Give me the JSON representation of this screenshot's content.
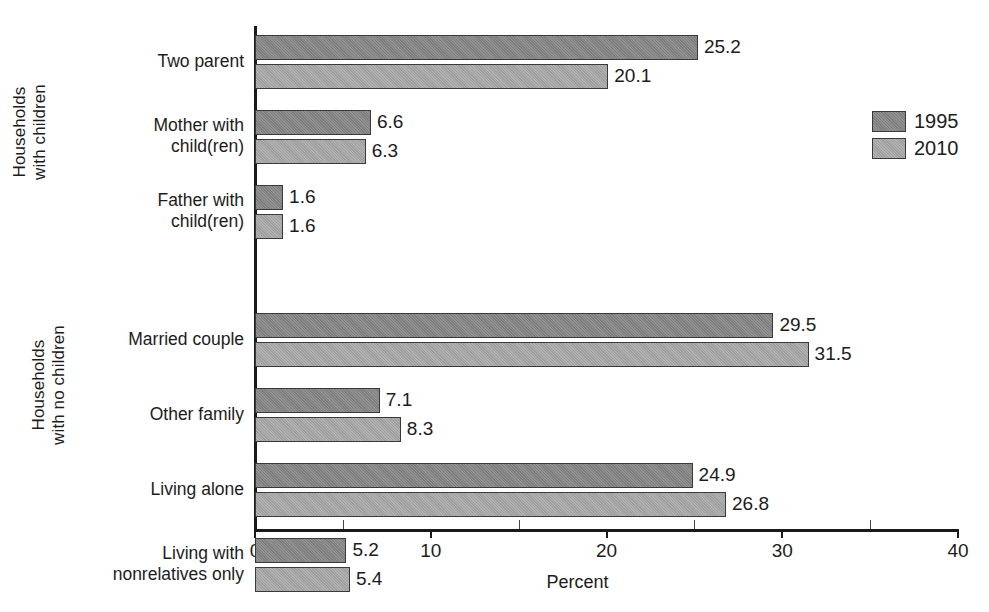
{
  "chart_data": {
    "type": "bar",
    "orientation": "horizontal",
    "title": "",
    "xlabel": "Percent",
    "ylabel": "",
    "xlim": [
      0,
      40
    ],
    "xticks": [
      0,
      10,
      20,
      30,
      40
    ],
    "xtick_labels": [
      "0",
      "10",
      "20",
      "30",
      "40"
    ],
    "minor_xticks": [
      5,
      15,
      25,
      35
    ],
    "grid": false,
    "legend_position": "right",
    "series": [
      {
        "name": "1995",
        "color": "#858585",
        "values": [
          25.2,
          6.6,
          1.6,
          29.5,
          7.1,
          24.9,
          5.2
        ]
      },
      {
        "name": "2010",
        "color": "#a5a5a5",
        "values": [
          20.1,
          6.3,
          1.6,
          31.5,
          8.3,
          26.8,
          5.4
        ]
      }
    ],
    "categories": [
      "Two parent",
      "Mother with child(ren)",
      "Father with child(ren)",
      "Married couple",
      "Other family",
      "Living alone",
      "Living with nonrelatives only"
    ],
    "groups": [
      {
        "caption": "Households with children",
        "categories": [
          0,
          1,
          2
        ]
      },
      {
        "caption": "Households with no children",
        "categories": [
          3,
          4,
          5,
          6
        ]
      }
    ]
  },
  "axis": {
    "x_title": "Percent",
    "tick_labels": [
      "0",
      "10",
      "20",
      "30",
      "40"
    ]
  },
  "group_captions": {
    "children": {
      "line1": "Households",
      "line2": "with children"
    },
    "no_children": {
      "line1": "Households",
      "line2": "with no children"
    }
  },
  "categories": [
    {
      "id": "two-parent",
      "line1": "Two parent",
      "line2": ""
    },
    {
      "id": "mother-with-children",
      "line1": "Mother with",
      "line2": "child(ren)"
    },
    {
      "id": "father-with-children",
      "line1": "Father with",
      "line2": "child(ren)"
    },
    {
      "id": "married-couple",
      "line1": "Married couple",
      "line2": ""
    },
    {
      "id": "other-family",
      "line1": "Other family",
      "line2": ""
    },
    {
      "id": "living-alone",
      "line1": "Living alone",
      "line2": ""
    },
    {
      "id": "living-nonrelatives",
      "line1": "Living with",
      "line2": "nonrelatives only"
    }
  ],
  "bars": [
    {
      "id": "two-parent-1995",
      "series": "1995",
      "value": 25.2,
      "label": "25.2"
    },
    {
      "id": "two-parent-2010",
      "series": "2010",
      "value": 20.1,
      "label": "20.1"
    },
    {
      "id": "mother-1995",
      "series": "1995",
      "value": 6.6,
      "label": "6.6"
    },
    {
      "id": "mother-2010",
      "series": "2010",
      "value": 6.3,
      "label": "6.3"
    },
    {
      "id": "father-1995",
      "series": "1995",
      "value": 1.6,
      "label": "1.6"
    },
    {
      "id": "father-2010",
      "series": "2010",
      "value": 1.6,
      "label": "1.6"
    },
    {
      "id": "married-couple-1995",
      "series": "1995",
      "value": 29.5,
      "label": "29.5"
    },
    {
      "id": "married-couple-2010",
      "series": "2010",
      "value": 31.5,
      "label": "31.5"
    },
    {
      "id": "other-family-1995",
      "series": "1995",
      "value": 7.1,
      "label": "7.1"
    },
    {
      "id": "other-family-2010",
      "series": "2010",
      "value": 8.3,
      "label": "8.3"
    },
    {
      "id": "living-alone-1995",
      "series": "1995",
      "value": 24.9,
      "label": "24.9"
    },
    {
      "id": "living-alone-2010",
      "series": "2010",
      "value": 26.8,
      "label": "26.8"
    },
    {
      "id": "nonrelatives-1995",
      "series": "1995",
      "value": 5.2,
      "label": "5.2"
    },
    {
      "id": "nonrelatives-2010",
      "series": "2010",
      "value": 5.4,
      "label": "5.4"
    }
  ],
  "legend": {
    "items": [
      {
        "label": "1995",
        "color": "#858585"
      },
      {
        "label": "2010",
        "color": "#a5a5a5"
      }
    ]
  }
}
